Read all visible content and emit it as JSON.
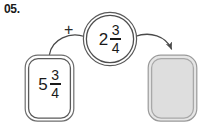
{
  "problem": {
    "number_label": "05.",
    "operator": "+",
    "operator_icon": "plus-icon"
  },
  "addend_box": {
    "name": "left-addend",
    "whole": "5",
    "numerator": "3",
    "denominator": "4",
    "full_value": "5 3/4",
    "fill_color": "#ffffff",
    "stroke_color": "#6e6e6e"
  },
  "addend_circle": {
    "name": "second-addend",
    "whole": "2",
    "numerator": "3",
    "denominator": "4",
    "full_value": "2 3/4",
    "fill_color": "#ffffff",
    "stroke_color": "#5a5a5a"
  },
  "answer_box": {
    "name": "answer-blank",
    "value": "",
    "fill_color": "#dedede",
    "stroke_color": "#9a9a9a"
  },
  "connectors": [
    {
      "name": "left-curve",
      "from": "left-addend",
      "to": "second-addend",
      "has_arrowhead": false,
      "color": "#4a4a4a"
    },
    {
      "name": "right-arrow",
      "from": "second-addend",
      "to": "answer-blank",
      "has_arrowhead": true,
      "color": "#4a4a4a"
    }
  ]
}
